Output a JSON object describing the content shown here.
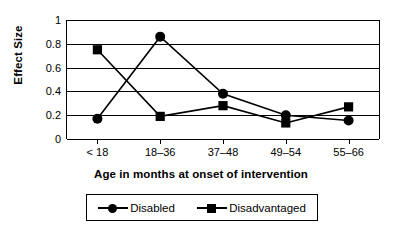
{
  "chart_data": {
    "type": "line",
    "title": "",
    "xlabel": "Age in months at onset of intervention",
    "ylabel": "Effect Size",
    "categories": [
      "< 18",
      "18–36",
      "37–48",
      "49–54",
      "55–66"
    ],
    "ylim": [
      0,
      1
    ],
    "yticks": [
      "0",
      "0.2",
      "0.4",
      "0.6",
      "0.8",
      "1"
    ],
    "ytick_values": [
      0,
      0.2,
      0.4,
      0.6,
      0.8,
      1
    ],
    "grid": "horizontal",
    "legend_position": "below-plot",
    "series": [
      {
        "name": "Disabled",
        "marker": "circle",
        "color": "#000000",
        "values": [
          0.17,
          0.86,
          0.38,
          0.2,
          0.155
        ]
      },
      {
        "name": "Disadvantaged",
        "marker": "square",
        "color": "#000000",
        "values": [
          0.75,
          0.19,
          0.28,
          0.135,
          0.27
        ]
      }
    ]
  },
  "legend": {
    "entries": [
      {
        "label": "Disabled",
        "marker": "circle-marker-icon"
      },
      {
        "label": "Disadvantaged",
        "marker": "square-marker-icon"
      }
    ]
  }
}
